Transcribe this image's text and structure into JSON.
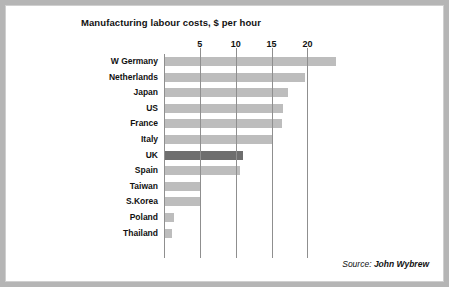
{
  "chart_data": {
    "type": "bar",
    "orientation": "horizontal",
    "title": "Manufacturing labour costs, $ per hour",
    "xlabel": "",
    "ylabel": "",
    "xlim": [
      0,
      26.5
    ],
    "grid": true,
    "gridlines": "vertical",
    "legend": "none",
    "xticks": [
      0,
      5,
      10,
      15,
      20
    ],
    "xticklabels": [
      "",
      "5",
      "10",
      "15",
      "20"
    ],
    "categories": [
      "W Germany",
      "Netherlands",
      "Japan",
      "US",
      "France",
      "Italy",
      "UK",
      "Spain",
      "Taiwan",
      "S.Korea",
      "Poland",
      "Thailand"
    ],
    "values": [
      24.0,
      19.6,
      17.3,
      16.6,
      16.4,
      15.0,
      11.0,
      10.6,
      5.2,
      5.0,
      1.4,
      1.1
    ],
    "bar_colors": [
      "#bdbdbd",
      "#bdbdbd",
      "#bdbdbd",
      "#bdbdbd",
      "#bdbdbd",
      "#bdbdbd",
      "#6e6e6e",
      "#bdbdbd",
      "#bdbdbd",
      "#bdbdbd",
      "#bdbdbd",
      "#bdbdbd"
    ],
    "highlight_category": "UK",
    "colors": {
      "bar_default": "#bdbdbd",
      "bar_highlight": "#6e6e6e",
      "gridline": "#8f8f8f",
      "text": "#111111",
      "background": "#ffffff",
      "frame": "#b5b5b5"
    }
  },
  "source": {
    "prefix": "Source:",
    "name": "John Wybrew"
  }
}
